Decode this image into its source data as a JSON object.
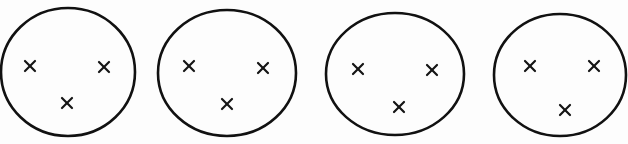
{
  "diagram": {
    "stroke_color": "#111111",
    "background_color": "#ffffff",
    "circles": [
      {
        "label": "circle-1",
        "cx": 68,
        "cy": 72,
        "rx": 67,
        "ry": 64,
        "marks": [
          {
            "x": 30,
            "y": 66
          },
          {
            "x": 104,
            "y": 67
          },
          {
            "x": 67,
            "y": 103
          }
        ]
      },
      {
        "label": "circle-2",
        "cx": 227,
        "cy": 73,
        "rx": 69,
        "ry": 63,
        "marks": [
          {
            "x": 189,
            "y": 66
          },
          {
            "x": 263,
            "y": 68
          },
          {
            "x": 227,
            "y": 104
          }
        ]
      },
      {
        "label": "circle-3",
        "cx": 395,
        "cy": 74,
        "rx": 69,
        "ry": 61,
        "marks": [
          {
            "x": 358,
            "y": 69
          },
          {
            "x": 432,
            "y": 70
          },
          {
            "x": 399,
            "y": 107
          }
        ]
      },
      {
        "label": "circle-4",
        "cx": 560,
        "cy": 75,
        "rx": 66,
        "ry": 61,
        "marks": [
          {
            "x": 530,
            "y": 66
          },
          {
            "x": 594,
            "y": 66
          },
          {
            "x": 565,
            "y": 110
          }
        ]
      }
    ]
  }
}
